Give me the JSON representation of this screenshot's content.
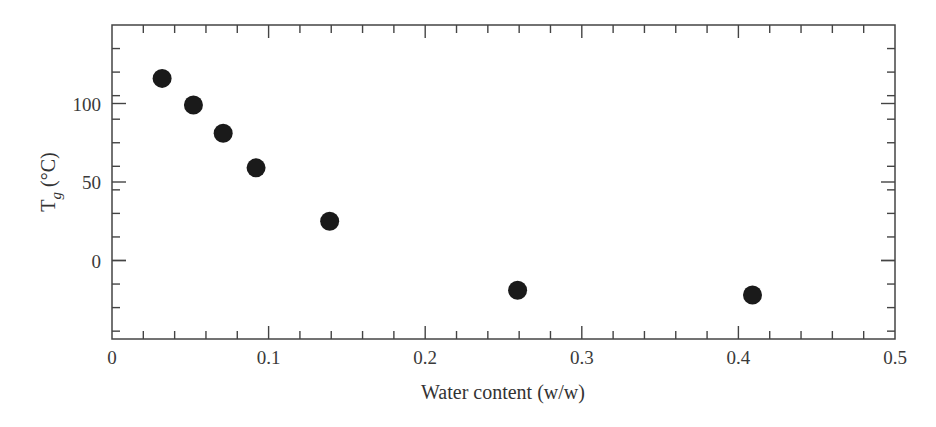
{
  "chart_data": {
    "type": "scatter",
    "title": "",
    "xlabel": "Water content (w/w)",
    "ylabel": "T_g (°C)",
    "ylabel_parts": {
      "main": "T",
      "sub": "g",
      "unit": " (°C)"
    },
    "xlim": [
      0,
      0.5
    ],
    "ylim": [
      -50,
      150
    ],
    "xticks": [
      0,
      0.1,
      0.2,
      0.3,
      0.4,
      0.5
    ],
    "xtick_labels": [
      "0",
      "0.1",
      "0.2",
      "0.3",
      "0.4",
      "0.5"
    ],
    "x_minor_step": 0.02,
    "yticks": [
      0,
      50,
      100
    ],
    "ytick_labels": [
      "0",
      "50",
      "100"
    ],
    "y_minor_step": 15,
    "grid": false,
    "legend": null,
    "marker_color": "#1a1a1a",
    "axis_color": "#444444",
    "series": [
      {
        "name": "Tg vs water content",
        "x": [
          0.032,
          0.052,
          0.071,
          0.092,
          0.139,
          0.259,
          0.409
        ],
        "y": [
          116,
          99,
          81,
          59,
          25,
          -19,
          -22
        ]
      }
    ]
  }
}
